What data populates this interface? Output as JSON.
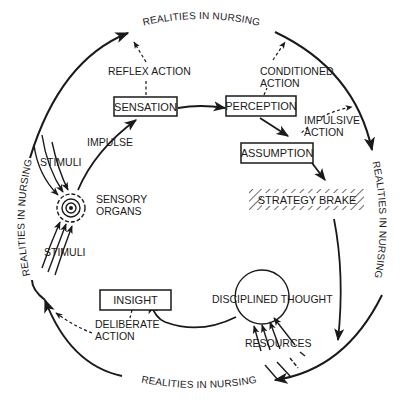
{
  "diagram": {
    "outer_ring_label": "REALITIES IN NURSING",
    "ring_labels": [
      {
        "position": "top",
        "text": "REALITIES IN NURSING"
      },
      {
        "position": "right",
        "text": "REALITIES IN NURSING"
      },
      {
        "position": "bottom",
        "text": "REALITIES IN NURSING"
      },
      {
        "position": "left",
        "text": "REALITIES IN NURSING"
      }
    ],
    "boxes": {
      "sensation": "SENSATION",
      "perception": "PERCEPTION",
      "assumption": "ASSUMPTION",
      "strategy_brake": "STRATEGY BRAKE",
      "insight": "INSIGHT"
    },
    "nodes": {
      "sensory_organs_line1": "SENSORY",
      "sensory_organs_line2": "ORGANS",
      "disciplined_thought": "DISCIPLINED THOUGHT"
    },
    "labels": {
      "reflex_action": "REFLEX ACTION",
      "conditioned_action_line1": "CONDITIONED",
      "conditioned_action_line2": "ACTION",
      "impulsive_action_line1": "IMPULSIVE",
      "impulsive_action_line2": "ACTION",
      "impulse": "IMPULSE",
      "stimuli_top": "STIMULI",
      "stimuli_bottom": "STIMULI",
      "deliberate_action_line1": "DELIBERATE",
      "deliberate_action_line2": "ACTION",
      "resources": "RESOURCES"
    },
    "colors": {
      "ink": "#1a1a1a",
      "background": "#ffffff"
    }
  }
}
